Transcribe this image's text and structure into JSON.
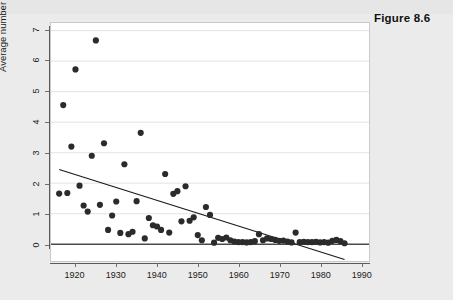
{
  "figure": {
    "caption": "Figure 8.6"
  },
  "chart_data": {
    "type": "scatter",
    "title": "",
    "subtitle": "",
    "xlabel": "",
    "ylabel": "Average number of lives lost",
    "xlim": [
      1914,
      1992
    ],
    "ylim": [
      -0.55,
      7.25
    ],
    "xticks": [
      1920,
      1930,
      1940,
      1950,
      1960,
      1970,
      1980,
      1990
    ],
    "xtick_labels": [
      "1920",
      "1930",
      "1940",
      "1950",
      "1960",
      "1970",
      "1980",
      "1990"
    ],
    "yticks": [
      0,
      1,
      2,
      3,
      4,
      5,
      6,
      7
    ],
    "ytick_labels": [
      "0",
      "1",
      "2",
      "3",
      "4",
      "5",
      "6",
      "7"
    ],
    "grid": "horizontal",
    "grid_color": "#e3e3e3",
    "legend": "none",
    "marker": {
      "shape": "circle",
      "color": "#2b2b2b",
      "size_px": 3.1
    },
    "series": [
      {
        "name": "Average number of lives lost",
        "x": [
          1916,
          1917,
          1918,
          1919,
          1920,
          1921,
          1922,
          1923,
          1924,
          1925,
          1926,
          1927,
          1928,
          1929,
          1930,
          1931,
          1932,
          1933,
          1934,
          1935,
          1936,
          1937,
          1938,
          1939,
          1940,
          1941,
          1942,
          1943,
          1944,
          1945,
          1946,
          1947,
          1948,
          1949,
          1950,
          1951,
          1952,
          1953,
          1954,
          1955,
          1956,
          1957,
          1958,
          1959,
          1960,
          1961,
          1962,
          1963,
          1964,
          1965,
          1966,
          1967,
          1968,
          1969,
          1970,
          1971,
          1972,
          1973,
          1974,
          1975,
          1976,
          1977,
          1978,
          1979,
          1980,
          1981,
          1982,
          1983,
          1984,
          1985,
          1986
        ],
        "y": [
          1.66,
          4.56,
          1.68,
          3.2,
          5.73,
          1.92,
          1.27,
          1.07,
          2.9,
          6.68,
          1.29,
          3.31,
          0.47,
          0.94,
          1.4,
          0.37,
          2.62,
          0.33,
          0.41,
          1.41,
          3.65,
          0.19,
          0.86,
          0.62,
          0.58,
          0.47,
          2.3,
          0.38,
          1.65,
          1.74,
          0.75,
          1.9,
          0.77,
          0.88,
          0.3,
          0.13,
          1.22,
          0.96,
          0.05,
          0.21,
          0.17,
          0.22,
          0.13,
          0.09,
          0.07,
          0.07,
          0.06,
          0.07,
          0.1,
          0.33,
          0.13,
          0.19,
          0.17,
          0.14,
          0.11,
          0.12,
          0.09,
          0.06,
          0.38,
          0.07,
          0.08,
          0.07,
          0.07,
          0.08,
          0.06,
          0.07,
          0.05,
          0.11,
          0.14,
          0.1,
          0.03
        ]
      }
    ],
    "fit_line": {
      "name": "linear-fit",
      "x": [
        1916,
        1986
      ],
      "y": [
        2.45,
        -0.5
      ],
      "color": "#1a1a1a",
      "width_px": 1.2
    },
    "zero_line": {
      "name": "zero-reference",
      "y": 0,
      "color": "#4a4a4a",
      "width_px": 1.4
    }
  }
}
